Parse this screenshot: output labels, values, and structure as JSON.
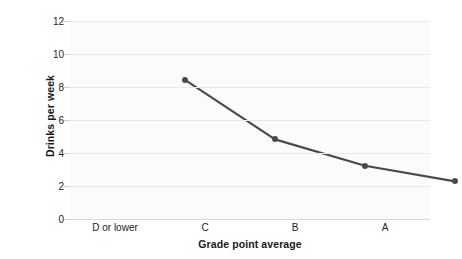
{
  "chart_data": {
    "type": "line",
    "title": "",
    "categories": [
      "D or lower",
      "C",
      "B",
      "A"
    ],
    "values": [
      9.7,
      6.1,
      4.5,
      3.55
    ],
    "series": [
      {
        "name": "Drinks per week",
        "values": [
          9.7,
          6.1,
          4.5,
          3.55
        ]
      }
    ],
    "xlabel": "Grade point average",
    "ylabel": "Drinks per week",
    "ylim": [
      0,
      12
    ],
    "yticks": [
      0,
      2,
      4,
      6,
      8,
      10,
      12
    ],
    "ytick_labels": [
      "0",
      "2",
      "4",
      "6",
      "8",
      "10",
      "12"
    ],
    "grid": "horizontal",
    "legend": "none",
    "line_color": "#4a4a4a",
    "marker_color": "#4a4a4a",
    "plot_background": "#fbfbfb",
    "gridline_color": "#e9e9e9"
  }
}
